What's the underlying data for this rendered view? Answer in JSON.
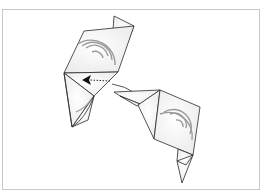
{
  "diagram": {
    "type": "origami-step",
    "arrow": {
      "kind": "dotted-push-arrow",
      "direction": "left"
    },
    "colors": {
      "outline": "#2a2a2a",
      "paper": "#f4f4f4",
      "pattern": "#9a9a9a",
      "frame": "#c8c8c8"
    }
  }
}
